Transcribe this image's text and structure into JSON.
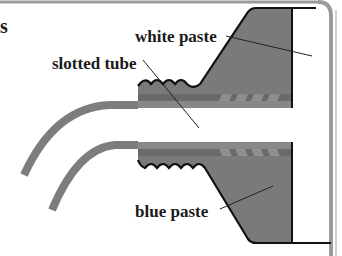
{
  "title_fragment": "s",
  "labels": {
    "white_paste": "white paste",
    "slotted_tube": "slotted tube",
    "blue_paste": "blue paste"
  },
  "colors": {
    "paste_fill": "#7a7a7a",
    "tube": "#7d7d7d",
    "band_dark": "#6a6a6a",
    "band_light": "#8c8c8c",
    "outline": "#111111",
    "frame": "#9a9a9a",
    "background": "#ffffff"
  }
}
